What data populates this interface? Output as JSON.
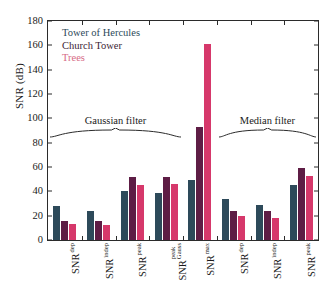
{
  "chart_data": {
    "type": "bar",
    "title": "",
    "xlabel": "",
    "ylabel": "SNR (dB)",
    "ylim": [
      0,
      180
    ],
    "ytick_step": 20,
    "yticks": [
      0,
      20,
      40,
      60,
      80,
      100,
      120,
      140,
      160,
      180
    ],
    "grid": false,
    "legend_position": "upper-left-inside",
    "categories": [
      "SNR dep",
      "SNR indep",
      "SNR peak",
      "SNR peak Gauss",
      "SNR max",
      "SNR dep",
      "SNR indep",
      "SNR peak"
    ],
    "category_parts": [
      {
        "base": "SNR",
        "sub": "dep",
        "sub2": ""
      },
      {
        "base": "SNR",
        "sub": "indep",
        "sub2": ""
      },
      {
        "base": "SNR",
        "sub": "peak",
        "sub2": ""
      },
      {
        "base": "SNR",
        "sub": "peak",
        "sub2": "Gauss"
      },
      {
        "base": "SNR",
        "sub": "max",
        "sub2": ""
      },
      {
        "base": "SNR",
        "sub": "dep",
        "sub2": ""
      },
      {
        "base": "SNR",
        "sub": "indep",
        "sub2": ""
      },
      {
        "base": "SNR",
        "sub": "peak",
        "sub2": ""
      }
    ],
    "series": [
      {
        "name": "Tower of Hercules",
        "color": "#2d4a5a",
        "values": [
          28,
          23.5,
          40.5,
          39,
          49,
          33.5,
          29,
          45
        ]
      },
      {
        "name": "Church Tower",
        "color": "#5e1d45",
        "values": [
          16,
          16,
          51.5,
          51.5,
          93,
          23.5,
          23.5,
          59
        ]
      },
      {
        "name": "Trees",
        "color": "#d6386b",
        "values": [
          13,
          12,
          45.5,
          46,
          161,
          20,
          18.5,
          52.5
        ]
      }
    ],
    "annotations": [
      {
        "label": "Gaussian filter",
        "type": "brace",
        "spans_categories": [
          0,
          3
        ]
      },
      {
        "label": "Median filter",
        "type": "brace",
        "spans_categories": [
          5,
          7
        ]
      }
    ]
  },
  "legend": {
    "items": [
      {
        "label": "Tower of Hercules",
        "color": "#2d4a5a"
      },
      {
        "label": "Church Tower",
        "color": "#3d2436"
      },
      {
        "label": "Trees",
        "color": "#d66b86"
      }
    ]
  },
  "annotations": {
    "gaussian": "Gaussian filter",
    "median": "Median filter"
  },
  "axis": {
    "y_title": "SNR (dB)"
  }
}
